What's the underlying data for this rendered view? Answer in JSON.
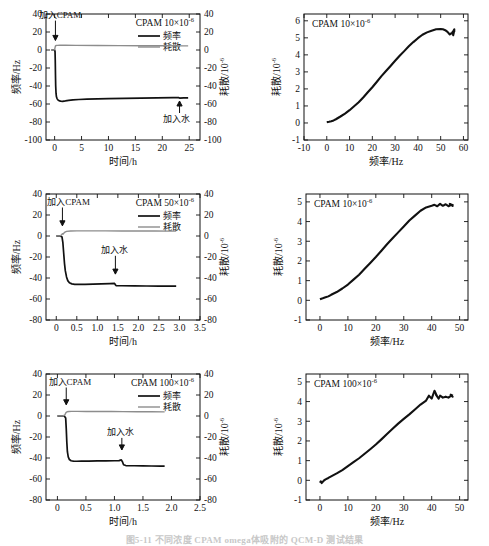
{
  "figure": {
    "caption": "图5-11  不同浓度 CPAM omega体吸附的 QCM-D 测试结果",
    "caption_visible": false
  },
  "common": {
    "axis_time": "时间/h",
    "axis_freq_x": "频率/Hz",
    "axis_freq_y": "频率/Hz",
    "axis_diss": "耗散/10",
    "diss_exp": "-6",
    "legend_freq": "频率",
    "legend_diss": "耗散",
    "ann_add_cpam": "加入CPAM",
    "ann_add_water": "加入水",
    "color_freq": "#111111",
    "color_diss": "#8d8d8d"
  },
  "chart_data": [
    {
      "id": "panel-a",
      "type": "line",
      "title": "CPAM  10×10",
      "title_exp": "-6",
      "xlabel": "时间/h",
      "ylabel": "频率/Hz",
      "y2label": "耗散/10",
      "xlim": [
        -1.6,
        27
      ],
      "ylim": [
        -100,
        40
      ],
      "y2lim": [
        -100,
        40
      ],
      "xticks": [
        0,
        5,
        10,
        15,
        20,
        25
      ],
      "yticks": [
        40,
        20,
        0,
        -20,
        -40,
        -60,
        -80,
        -100
      ],
      "y2ticks": [
        40,
        20,
        0,
        -20,
        -40,
        -60,
        -80,
        -100
      ],
      "grid": false,
      "legend_position": "top-right",
      "annotations": [
        {
          "text": "加入CPAM",
          "x": 1.0,
          "y": 36,
          "arrow_to_x": 0.15,
          "arrow_to_y": 4
        },
        {
          "text": "加入水",
          "x": 22.6,
          "y": -80,
          "arrow_to_x": 23.2,
          "arrow_to_y": -50
        }
      ],
      "series": [
        {
          "name": "频率",
          "color": "#111111",
          "x": [
            -0.6,
            -0.3,
            0,
            0.08,
            0.12,
            0.16,
            0.2,
            0.26,
            0.34,
            0.45,
            0.6,
            0.8,
            1.1,
            1.5,
            2.0,
            2.6,
            3.4,
            4.5,
            6,
            8,
            10,
            13,
            16,
            19,
            22,
            23.0,
            23.2,
            24,
            24.8
          ],
          "y": [
            0,
            0,
            0,
            -2,
            -12,
            -28,
            -40,
            -48,
            -52,
            -54,
            -55.4,
            -56.2,
            -56.8,
            -57.0,
            -56.6,
            -56.0,
            -55.4,
            -55.0,
            -54.6,
            -54.2,
            -54.0,
            -53.7,
            -53.4,
            -53.2,
            -53.0,
            -52.9,
            -53.4,
            -53.2,
            -53.1
          ]
        },
        {
          "name": "耗散",
          "color": "#8d8d8d",
          "x": [
            -0.6,
            -0.2,
            0,
            0.08,
            0.14,
            0.2,
            0.3,
            0.5,
            1.0,
            2.0,
            4.0,
            8.0,
            12,
            16,
            20,
            24,
            24.8
          ],
          "y": [
            0,
            0,
            0.4,
            2.6,
            4.2,
            4.8,
            5.0,
            5.1,
            5.2,
            5.2,
            5.1,
            5.0,
            4.9,
            4.8,
            4.7,
            4.6,
            4.6
          ]
        }
      ]
    },
    {
      "id": "panel-b",
      "type": "scatter",
      "title": "CPAM  10×10",
      "title_exp": "-6",
      "xlabel": "频率/Hz",
      "ylabel": "耗散/10",
      "ylabel_exp": "-6",
      "xlim": [
        -10,
        62
      ],
      "ylim": [
        -1,
        6.4
      ],
      "xticks": [
        -10,
        0,
        10,
        20,
        30,
        40,
        50,
        60
      ],
      "yticks": [
        -1,
        0,
        1,
        2,
        3,
        4,
        5,
        6
      ],
      "grid": false,
      "series": [
        {
          "name": "D-f",
          "color": "#111111",
          "x": [
            0,
            1,
            2,
            3,
            4,
            6,
            8,
            10,
            12,
            14,
            16,
            18,
            20,
            22,
            24,
            26,
            28,
            30,
            32,
            34,
            36,
            38,
            40,
            42,
            44,
            46,
            48,
            50,
            51,
            52,
            53,
            54,
            55,
            56,
            55.5,
            56,
            55,
            56.2
          ],
          "y": [
            0.05,
            0.07,
            0.1,
            0.15,
            0.22,
            0.38,
            0.55,
            0.75,
            0.98,
            1.22,
            1.5,
            1.8,
            2.1,
            2.42,
            2.75,
            3.05,
            3.35,
            3.65,
            3.95,
            4.22,
            4.5,
            4.75,
            4.98,
            5.18,
            5.32,
            5.42,
            5.5,
            5.52,
            5.5,
            5.45,
            5.35,
            5.2,
            5.3,
            5.45,
            5.15,
            5.5,
            5.25,
            5.4
          ]
        }
      ]
    },
    {
      "id": "panel-c",
      "type": "line",
      "title": "CPAM  50×10",
      "title_exp": "-6",
      "xlabel": "时间/h",
      "ylabel": "频率/Hz",
      "y2label": "耗散/10",
      "xlim": [
        -0.25,
        3.5
      ],
      "ylim": [
        -80,
        40
      ],
      "y2lim": [
        -80,
        40
      ],
      "xticks": [
        0,
        0.5,
        1.0,
        1.5,
        2.0,
        2.5,
        3.0,
        3.5
      ],
      "xtick_labels": [
        "0",
        "0.5",
        "1.0",
        "1.5",
        "2.0",
        "2.5",
        "3.0",
        "3.5"
      ],
      "yticks": [
        40,
        20,
        0,
        -20,
        -40,
        -60,
        -80
      ],
      "y2ticks": [
        40,
        20,
        0,
        -20,
        -40,
        -60,
        -80
      ],
      "grid": false,
      "legend_position": "top-right",
      "annotations": [
        {
          "text": "加入CPAM",
          "x": 0.3,
          "y": 30,
          "arrow_to_x": 0.15,
          "arrow_to_y": 4
        },
        {
          "text": "加入水",
          "x": 1.42,
          "y": -16,
          "arrow_to_x": 1.44,
          "arrow_to_y": -42
        }
      ],
      "series": [
        {
          "name": "频率",
          "color": "#111111",
          "x": [
            0,
            0.05,
            0.1,
            0.14,
            0.16,
            0.18,
            0.2,
            0.22,
            0.25,
            0.28,
            0.32,
            0.38,
            0.45,
            0.55,
            0.7,
            0.9,
            1.1,
            1.3,
            1.42,
            1.44,
            1.46,
            1.6,
            1.9,
            2.2,
            2.5,
            2.8,
            2.92
          ],
          "y": [
            0,
            0,
            0,
            -1,
            -6,
            -16,
            -26,
            -33,
            -39,
            -42.5,
            -44.5,
            -45.6,
            -46.0,
            -46.1,
            -46.0,
            -45.8,
            -45.6,
            -45.4,
            -45.2,
            -46.6,
            -47.3,
            -47.4,
            -47.5,
            -47.6,
            -47.7,
            -47.8,
            -47.8
          ]
        },
        {
          "name": "耗散",
          "color": "#8d8d8d",
          "x": [
            0,
            0.06,
            0.1,
            0.13,
            0.15,
            0.17,
            0.2,
            0.25,
            0.35,
            0.5,
            0.8,
            1.2,
            1.6,
            2.0,
            2.4,
            2.8,
            2.92
          ],
          "y": [
            0.1,
            0.1,
            0.2,
            1.2,
            2.2,
            1.9,
            3.4,
            4.4,
            4.8,
            4.9,
            4.9,
            4.85,
            4.8,
            4.75,
            4.7,
            4.65,
            4.6
          ]
        }
      ]
    },
    {
      "id": "panel-d",
      "type": "scatter",
      "title": "CPAM  10×10",
      "title_exp": "-6",
      "xlabel": "频率/Hz",
      "ylabel": "耗散/10",
      "ylabel_exp": "-6",
      "xlim": [
        -5,
        53
      ],
      "ylim": [
        -1,
        5.4
      ],
      "xticks": [
        0,
        10,
        20,
        30,
        40,
        50
      ],
      "yticks": [
        -1,
        0,
        1,
        2,
        3,
        4,
        5
      ],
      "grid": false,
      "series": [
        {
          "name": "D-f",
          "color": "#111111",
          "x": [
            0,
            0.5,
            1,
            2,
            3,
            4,
            6,
            8,
            10,
            12,
            14,
            16,
            18,
            20,
            22,
            24,
            26,
            28,
            30,
            32,
            34,
            36,
            38,
            40,
            41,
            42,
            43,
            44,
            45,
            46,
            47,
            47.5,
            46.5,
            47.8
          ],
          "y": [
            0.05,
            0.08,
            0.1,
            0.15,
            0.2,
            0.28,
            0.42,
            0.6,
            0.8,
            1.05,
            1.3,
            1.6,
            1.9,
            2.2,
            2.52,
            2.85,
            3.15,
            3.45,
            3.75,
            4.05,
            4.3,
            4.55,
            4.72,
            4.8,
            4.85,
            4.78,
            4.9,
            4.8,
            4.88,
            4.78,
            4.85,
            4.8,
            4.9,
            4.82
          ]
        }
      ]
    },
    {
      "id": "panel-e",
      "type": "line",
      "title": "CPAM  100×10",
      "title_exp": "-6",
      "xlabel": "时间/h",
      "ylabel": "频率/Hz",
      "y2label": "耗散/10",
      "xlim": [
        -0.2,
        2.5
      ],
      "ylim": [
        -80,
        40
      ],
      "y2lim": [
        -80,
        40
      ],
      "xticks": [
        0,
        0.5,
        1.0,
        1.5,
        2.0,
        2.5
      ],
      "xtick_labels": [
        "0",
        "0.5",
        "1.0",
        "1.5",
        "2.0",
        "2.5"
      ],
      "yticks": [
        40,
        20,
        0,
        -20,
        -40,
        -60,
        -80
      ],
      "y2ticks": [
        40,
        20,
        0,
        -20,
        -40,
        -60,
        -80
      ],
      "grid": false,
      "legend_position": "top-right",
      "annotations": [
        {
          "text": "加入CPAM",
          "x": 0.22,
          "y": 30,
          "arrow_to_x": 0.155,
          "arrow_to_y": 5
        },
        {
          "text": "加入水",
          "x": 1.1,
          "y": -18,
          "arrow_to_x": 1.13,
          "arrow_to_y": -38
        }
      ],
      "series": [
        {
          "name": "频率",
          "color": "#111111",
          "x": [
            0,
            0.04,
            0.08,
            0.12,
            0.145,
            0.155,
            0.165,
            0.175,
            0.19,
            0.21,
            0.24,
            0.28,
            0.34,
            0.42,
            0.55,
            0.7,
            0.85,
            1.0,
            1.08,
            1.12,
            1.14,
            1.16,
            1.2,
            1.35,
            1.5,
            1.65,
            1.8,
            1.88
          ],
          "y": [
            0,
            0,
            0,
            0,
            -2,
            -12,
            -25,
            -34,
            -39,
            -41.5,
            -42.6,
            -43.0,
            -43.1,
            -43.0,
            -42.9,
            -42.8,
            -42.7,
            -42.6,
            -42.5,
            -41.8,
            -43.6,
            -46.4,
            -47.2,
            -47.4,
            -47.5,
            -47.6,
            -47.7,
            -47.7
          ]
        },
        {
          "name": "耗散",
          "color": "#8d8d8d",
          "x": [
            0,
            0.05,
            0.1,
            0.13,
            0.15,
            0.17,
            0.2,
            0.25,
            0.35,
            0.5,
            0.7,
            0.95,
            1.15,
            1.4,
            1.65,
            1.88
          ],
          "y": [
            0.1,
            0.1,
            0.15,
            1.0,
            3.2,
            4.0,
            4.3,
            4.4,
            4.4,
            4.35,
            4.3,
            4.25,
            4.2,
            4.1,
            4.0,
            3.9
          ]
        }
      ]
    },
    {
      "id": "panel-f",
      "type": "scatter",
      "title": "CPAM  100×10",
      "title_exp": "-6",
      "xlabel": "频率/Hz",
      "ylabel": "耗散/10",
      "ylabel_exp": "-6",
      "xlim": [
        -5,
        53
      ],
      "ylim": [
        -1,
        5.4
      ],
      "xticks": [
        0,
        10,
        20,
        30,
        40,
        50
      ],
      "yticks": [
        -1,
        0,
        1,
        2,
        3,
        4,
        5
      ],
      "grid": false,
      "series": [
        {
          "name": "D-f",
          "color": "#111111",
          "x": [
            0,
            0.3,
            0.6,
            1,
            1.5,
            2,
            3,
            4,
            6,
            8,
            10,
            12,
            14,
            16,
            18,
            20,
            22,
            24,
            26,
            28,
            30,
            32,
            34,
            36,
            38,
            39,
            40,
            41,
            42,
            41.5,
            42.5,
            43,
            44,
            45,
            46,
            47,
            47.5,
            46.8,
            47.6
          ],
          "y": [
            -0.12,
            -0.05,
            -0.14,
            -0.08,
            0,
            0.05,
            0.12,
            0.2,
            0.35,
            0.52,
            0.72,
            0.92,
            1.12,
            1.35,
            1.58,
            1.82,
            2.08,
            2.35,
            2.62,
            2.88,
            3.12,
            3.35,
            3.6,
            3.85,
            4.05,
            4.3,
            4.15,
            4.55,
            4.25,
            4.35,
            4.15,
            4.3,
            4.2,
            4.25,
            4.2,
            4.3,
            4.25,
            4.35,
            4.3
          ]
        }
      ]
    }
  ]
}
